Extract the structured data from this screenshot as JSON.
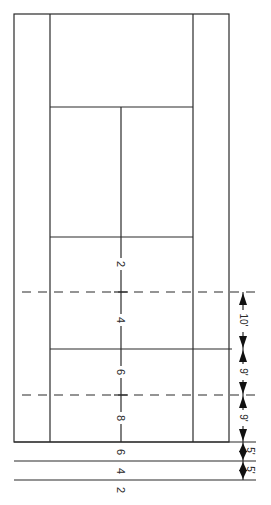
{
  "diagram": {
    "center_marks": [
      "2",
      "4",
      "6",
      "8"
    ],
    "behind_baseline_marks": [
      "6",
      "4",
      "2"
    ],
    "dimensions": [
      "10'",
      "9'",
      "9'",
      "5'",
      "5'"
    ],
    "colors": {
      "line": "#2a2a2a",
      "background": "#ffffff"
    }
  }
}
